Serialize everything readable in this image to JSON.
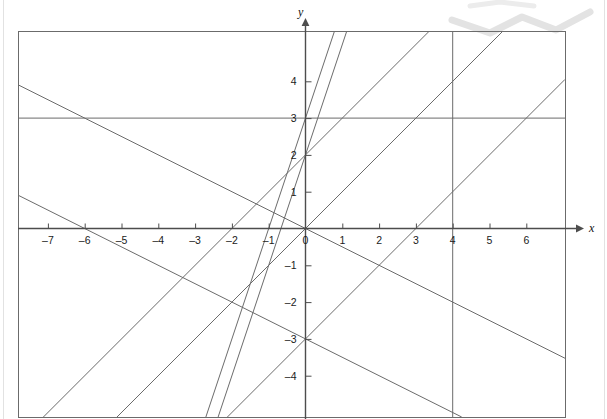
{
  "figure": {
    "title": "",
    "axis_labels": {
      "x": "x",
      "y": "y"
    },
    "colors": {
      "line": "#6b6b6b",
      "axis": "#4d4d4d",
      "frame": "#6b6b6b",
      "tick_text": "#1a1a1a",
      "watermark": "#e3e3e3",
      "page_edge": "#e2e2e2"
    }
  },
  "chart_data": {
    "type": "line",
    "title": "",
    "xlabel": "x",
    "ylabel": "y",
    "xlim": [
      -7.85,
      7.0
    ],
    "ylim": [
      -5.3,
      5.1
    ],
    "grid": false,
    "legend": "none",
    "xticks": [
      -7,
      -6,
      -5,
      -4,
      -3,
      -2,
      -1,
      0,
      1,
      2,
      3,
      4,
      5,
      6
    ],
    "xtick_labels": [
      "–7",
      "–6",
      "–5",
      "–4",
      "–3",
      "–2",
      "–1",
      "0",
      "1",
      "2",
      "3",
      "4",
      "5",
      "6"
    ],
    "yticks": [
      -4,
      -3,
      -2,
      -1,
      1,
      2,
      3,
      4
    ],
    "ytick_labels": [
      "–4",
      "–3",
      "–2",
      "–1",
      "1",
      "2",
      "3",
      "4"
    ],
    "series": [
      {
        "name": "y = 3",
        "kind": "horizontal",
        "slope": 0,
        "intercept": 3
      },
      {
        "name": "x = 4",
        "kind": "vertical",
        "x": 4
      },
      {
        "name": "y = 3x + 3",
        "kind": "linear",
        "slope": 3,
        "intercept": 3
      },
      {
        "name": "y = 3x + 2",
        "kind": "linear",
        "slope": 3,
        "intercept": 2
      },
      {
        "name": "y = x",
        "kind": "linear",
        "slope": 1,
        "intercept": 0
      },
      {
        "name": "y = x + 2",
        "kind": "linear",
        "slope": 1,
        "intercept": 2
      },
      {
        "name": "y = x - 3",
        "kind": "linear",
        "slope": 1,
        "intercept": -3
      },
      {
        "name": "y = -0.5x",
        "kind": "linear",
        "slope": -0.5,
        "intercept": 0
      },
      {
        "name": "y = -0.5x - 3",
        "kind": "linear",
        "slope": -0.5,
        "intercept": -3
      }
    ]
  }
}
